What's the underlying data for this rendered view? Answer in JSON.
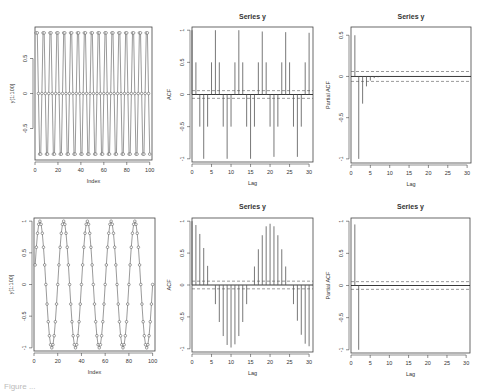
{
  "chart_data": [
    {
      "id": "series-top",
      "type": "line",
      "title": "",
      "xlabel": "Index",
      "ylabel": "y[1:100]",
      "xlim": [
        0,
        102
      ],
      "ylim": [
        -0.95,
        0.95
      ],
      "xticks": [
        0,
        20,
        40,
        60,
        80,
        100
      ],
      "yticks": [
        -0.5,
        0.0,
        0.5
      ],
      "description": "Period-6 pattern: 0.866, 0.866, 0, -0.866, -0.866, 0 repeating over index 1..100",
      "pattern": [
        0.866,
        0.866,
        0.0,
        -0.866,
        -0.866,
        0.0
      ],
      "n": 100
    },
    {
      "id": "acf-top",
      "type": "bar",
      "title": "Series  y",
      "xlabel": "Lag",
      "ylabel": "ACF",
      "xlim": [
        0,
        31
      ],
      "ylim": [
        -1.05,
        1.05
      ],
      "xticks": [
        0,
        5,
        10,
        15,
        20,
        25,
        30
      ],
      "yticks": [
        -1.0,
        -0.5,
        0.0,
        0.5,
        1.0
      ],
      "ci": 0.06,
      "lags": [
        0,
        1,
        2,
        3,
        4,
        5,
        6,
        7,
        8,
        9,
        10,
        11,
        12,
        13,
        14,
        15,
        16,
        17,
        18,
        19,
        20,
        21,
        22,
        23,
        24,
        25,
        26,
        27,
        28,
        29,
        30
      ],
      "values": [
        1.0,
        0.5,
        -0.5,
        -1.0,
        -0.5,
        0.5,
        1.0,
        0.5,
        -0.5,
        -1.0,
        -0.5,
        0.5,
        1.0,
        0.5,
        -0.5,
        -1.0,
        -0.5,
        0.5,
        0.98,
        0.5,
        -0.5,
        -0.97,
        -0.5,
        0.5,
        0.97,
        0.5,
        -0.5,
        -0.97,
        -0.5,
        0.5,
        0.96
      ]
    },
    {
      "id": "pacf-top",
      "type": "bar",
      "title": "Series  y",
      "xlabel": "Lag",
      "ylabel": "Partial ACF",
      "xlim": [
        0,
        31
      ],
      "ylim": [
        -1.05,
        0.6
      ],
      "xticks": [
        0,
        5,
        10,
        15,
        20,
        25,
        30
      ],
      "yticks": [
        -1.0,
        -0.5,
        0.0,
        0.5
      ],
      "ci": 0.06,
      "lags": [
        1,
        2,
        3,
        4,
        5,
        6,
        7,
        8
      ],
      "values": [
        0.5,
        -1.0,
        -0.33,
        -0.12,
        -0.05,
        -0.02,
        -0.01,
        0.0
      ]
    },
    {
      "id": "series-bottom",
      "type": "line",
      "title": "",
      "xlabel": "Index",
      "ylabel": "y[1:100]",
      "xlim": [
        0,
        102
      ],
      "ylim": [
        -1.05,
        1.05
      ],
      "xticks": [
        0,
        20,
        40,
        60,
        80,
        100
      ],
      "yticks": [
        -1.0,
        -0.5,
        0.0,
        0.5,
        1.0
      ],
      "description": "Sine wave with period 20: y = sin(2*pi*t/20), t = 1..100",
      "period": 20,
      "n": 100
    },
    {
      "id": "acf-bottom",
      "type": "bar",
      "title": "Series  y",
      "xlabel": "Lag",
      "ylabel": "ACF",
      "xlim": [
        0,
        31
      ],
      "ylim": [
        -1.05,
        1.05
      ],
      "xticks": [
        0,
        5,
        10,
        15,
        20,
        25,
        30
      ],
      "yticks": [
        -1.0,
        -0.5,
        0.0,
        0.5,
        1.0
      ],
      "ci": 0.06,
      "lags": [
        0,
        1,
        2,
        3,
        4,
        5,
        6,
        7,
        8,
        9,
        10,
        11,
        12,
        13,
        14,
        15,
        16,
        17,
        18,
        19,
        20,
        21,
        22,
        23,
        24,
        25,
        26,
        27,
        28,
        29,
        30
      ],
      "values": [
        1.0,
        0.94,
        0.8,
        0.58,
        0.3,
        0.0,
        -0.3,
        -0.58,
        -0.8,
        -0.94,
        -0.98,
        -0.93,
        -0.8,
        -0.58,
        -0.3,
        0.0,
        0.29,
        0.56,
        0.78,
        0.92,
        0.96,
        0.92,
        0.78,
        0.56,
        0.29,
        0.0,
        -0.3,
        -0.56,
        -0.78,
        -0.92,
        -0.96
      ]
    },
    {
      "id": "pacf-bottom",
      "type": "bar",
      "title": "Series  y",
      "xlabel": "Lag",
      "ylabel": "Partial ACF",
      "xlim": [
        0,
        31
      ],
      "ylim": [
        -1.05,
        1.05
      ],
      "xticks": [
        0,
        5,
        10,
        15,
        20,
        25,
        30
      ],
      "yticks": [
        -1.0,
        -0.5,
        0.0,
        0.5,
        1.0
      ],
      "ci": 0.06,
      "lags": [
        1,
        2
      ],
      "values": [
        0.95,
        -1.0
      ]
    }
  ],
  "caption": "Figure ..."
}
